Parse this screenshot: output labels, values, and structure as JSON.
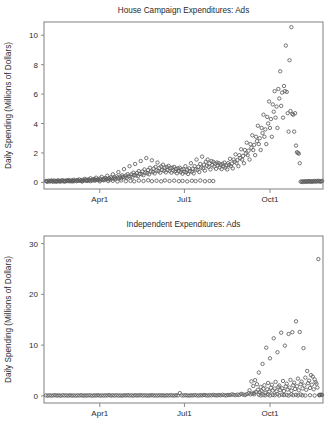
{
  "figure": {
    "background": "#ffffff",
    "marker_color": "#5d5d5d",
    "axis_color": "#8a8a8a",
    "text_color": "#2b2b2b"
  },
  "chart_data": [
    {
      "type": "scatter",
      "id": "house-campaign-ads",
      "title": "House Campaign Expenditures: Ads",
      "xlabel": "",
      "ylabel": "Daily Spending (Millions of Dollars)",
      "xlim": [
        0,
        300
      ],
      "ylim": [
        -0.45,
        10.9
      ],
      "grid": false,
      "legend": null,
      "xticks": [
        60,
        151,
        243
      ],
      "xticklabels": [
        "Apr1",
        "Jul1",
        "Oct1"
      ],
      "yticks": [
        0,
        2,
        4,
        6,
        8,
        10
      ],
      "yticklabels": [
        "0",
        "2",
        "4",
        "6",
        "8",
        "10"
      ],
      "marker": "open-circle",
      "x": [
        2,
        3,
        4,
        5,
        6,
        7,
        8,
        9,
        10,
        11,
        12,
        13,
        14,
        15,
        16,
        17,
        18,
        19,
        20,
        21,
        22,
        23,
        24,
        25,
        26,
        27,
        28,
        29,
        30,
        31,
        32,
        33,
        34,
        35,
        36,
        37,
        38,
        39,
        40,
        41,
        42,
        43,
        44,
        45,
        46,
        47,
        48,
        49,
        50,
        51,
        52,
        53,
        54,
        55,
        56,
        57,
        58,
        59,
        60,
        61,
        62,
        63,
        64,
        65,
        66,
        67,
        68,
        69,
        70,
        71,
        72,
        73,
        74,
        75,
        76,
        77,
        78,
        79,
        80,
        81,
        82,
        83,
        84,
        85,
        86,
        87,
        88,
        89,
        90,
        91,
        92,
        93,
        94,
        95,
        96,
        97,
        98,
        99,
        100,
        101,
        102,
        103,
        104,
        105,
        106,
        107,
        108,
        109,
        110,
        111,
        112,
        113,
        114,
        115,
        116,
        117,
        118,
        119,
        120,
        121,
        122,
        123,
        124,
        125,
        126,
        127,
        128,
        129,
        130,
        131,
        132,
        133,
        134,
        135,
        136,
        137,
        138,
        139,
        140,
        141,
        142,
        143,
        144,
        145,
        146,
        147,
        148,
        149,
        150,
        151,
        152,
        153,
        154,
        155,
        156,
        157,
        158,
        159,
        160,
        161,
        162,
        163,
        164,
        165,
        166,
        167,
        168,
        169,
        170,
        171,
        172,
        173,
        174,
        175,
        176,
        177,
        178,
        179,
        180,
        181,
        182,
        183,
        184,
        185,
        186,
        187,
        188,
        189,
        190,
        191,
        192,
        193,
        194,
        195,
        196,
        197,
        198,
        199,
        200,
        201,
        202,
        203,
        204,
        205,
        206,
        207,
        208,
        209,
        210,
        211,
        212,
        213,
        214,
        215,
        216,
        217,
        218,
        219,
        220,
        221,
        222,
        223,
        224,
        225,
        226,
        227,
        228,
        229,
        230,
        231,
        232,
        233,
        234,
        235,
        236,
        237,
        238,
        239,
        240,
        241,
        242,
        243,
        244,
        245,
        246,
        247,
        248,
        249,
        250,
        251,
        252,
        253,
        254,
        255,
        256,
        257,
        258,
        259,
        260,
        261,
        262,
        263,
        264,
        265,
        266,
        267,
        268,
        269,
        270,
        271,
        272,
        273,
        274,
        275,
        276,
        277,
        278,
        279,
        280,
        281,
        282,
        283,
        284,
        285,
        286,
        287,
        288,
        289,
        290,
        291,
        292,
        293,
        294,
        295,
        296,
        297,
        298,
        299,
        3,
        8,
        13,
        17,
        22,
        27,
        31,
        36,
        41,
        46,
        50,
        55,
        60,
        64,
        69,
        74,
        79,
        83,
        88,
        93,
        97,
        102,
        107,
        112,
        116,
        121,
        126,
        130,
        135,
        140,
        145,
        149,
        154,
        159,
        163,
        168,
        173,
        178,
        182,
        187,
        192,
        196,
        201,
        206,
        211,
        215,
        220,
        225,
        229,
        234,
        239,
        244,
        248,
        253,
        258,
        262,
        267,
        272,
        277,
        281,
        286,
        291,
        295
      ],
      "y": [
        0.1,
        0.07,
        0.05,
        0.12,
        0.08,
        0.06,
        0.11,
        0.09,
        0.04,
        0.13,
        0.07,
        0.1,
        0.06,
        0.14,
        0.09,
        0.05,
        0.12,
        0.08,
        0.15,
        0.07,
        0.11,
        0.06,
        0.13,
        0.09,
        0.16,
        0.08,
        0.12,
        0.07,
        0.14,
        0.1,
        0.18,
        0.09,
        0.13,
        0.08,
        0.16,
        0.11,
        0.2,
        0.1,
        0.15,
        0.09,
        0.18,
        0.13,
        0.24,
        0.12,
        0.17,
        0.11,
        0.21,
        0.15,
        0.28,
        0.14,
        0.19,
        0.13,
        0.23,
        0.17,
        0.32,
        0.16,
        0.22,
        0.15,
        0.26,
        0.19,
        0.38,
        0.18,
        0.25,
        0.17,
        0.3,
        0.22,
        0.45,
        0.21,
        0.29,
        0.2,
        0.35,
        0.26,
        0.55,
        0.25,
        0.34,
        0.23,
        0.41,
        0.31,
        0.7,
        0.29,
        0.4,
        0.27,
        0.48,
        0.36,
        0.9,
        0.34,
        0.47,
        0.31,
        0.56,
        0.42,
        1.1,
        0.4,
        0.55,
        0.36,
        0.66,
        0.5,
        1.25,
        0.47,
        0.64,
        0.42,
        0.77,
        0.58,
        1.45,
        0.55,
        0.74,
        0.49,
        0.88,
        0.66,
        1.65,
        0.62,
        0.84,
        0.55,
        0.99,
        0.74,
        1.5,
        0.7,
        0.94,
        0.61,
        1.05,
        0.8,
        1.35,
        0.76,
        0.99,
        0.66,
        1.08,
        0.84,
        1.2,
        0.79,
        1.0,
        0.68,
        1.05,
        0.84,
        1.12,
        0.78,
        0.97,
        0.66,
        1.0,
        0.8,
        1.05,
        0.74,
        0.92,
        0.62,
        0.95,
        0.76,
        1.0,
        0.7,
        0.88,
        0.59,
        0.9,
        0.72,
        1.1,
        0.68,
        0.86,
        0.57,
        0.95,
        0.76,
        1.3,
        0.72,
        0.92,
        0.61,
        1.1,
        0.88,
        1.55,
        0.84,
        1.06,
        0.7,
        1.25,
        1.0,
        1.75,
        0.95,
        1.2,
        0.8,
        1.4,
        1.12,
        1.55,
        1.05,
        1.3,
        0.88,
        1.45,
        1.18,
        1.4,
        1.08,
        1.28,
        0.92,
        1.35,
        1.15,
        1.3,
        1.02,
        1.2,
        0.9,
        1.25,
        1.1,
        1.35,
        1.0,
        1.15,
        0.88,
        1.3,
        1.18,
        1.6,
        1.1,
        1.28,
        0.95,
        1.55,
        1.4,
        1.9,
        1.3,
        1.52,
        1.1,
        1.85,
        1.65,
        2.25,
        1.55,
        1.8,
        1.3,
        2.2,
        1.95,
        2.7,
        1.85,
        2.15,
        1.55,
        2.6,
        2.35,
        3.2,
        2.2,
        2.55,
        1.85,
        3.1,
        2.8,
        3.85,
        2.6,
        3.0,
        2.2,
        3.7,
        3.35,
        4.6,
        3.1,
        3.6,
        2.6,
        4.45,
        4.0,
        5.5,
        3.7,
        4.3,
        3.1,
        5.3,
        4.8,
        6.2,
        4.4,
        5.15,
        3.7,
        6.35,
        5.7,
        7.55,
        5.2,
        6.1,
        4.4,
        6.55,
        6.2,
        9.3,
        6.15,
        4.7,
        3.45,
        8.3,
        4.85,
        10.55,
        4.65,
        4.6,
        3.45,
        4.7,
        2.5,
        2.05,
        2.0,
        1.95,
        1.3,
        0.05,
        0.04,
        0.06,
        0.03,
        0.07,
        0.05,
        0.08,
        0.04,
        0.06,
        0.09,
        0.05,
        0.07,
        0.04,
        0.08,
        0.06,
        0.1,
        0.05,
        0.09,
        0.07,
        0.11,
        0.06,
        0.08,
        0.05,
        0.1,
        0.07,
        0.12,
        0.06,
        0.09,
        0.08,
        0.11,
        0.07,
        0.13,
        0.06,
        0.1,
        0.08,
        0.12,
        0.07,
        0.14,
        0.09,
        0.11,
        0.06,
        0.13,
        0.08,
        0.1,
        0.07,
        0.12,
        0.09,
        0.14,
        0.08,
        0.11,
        0.07,
        0.13,
        0.09,
        0.12,
        0.08,
        0.1,
        0.07,
        0.11,
        0.09,
        0.13,
        0.08,
        0.1,
        0.09
      ]
    },
    {
      "type": "scatter",
      "id": "independent-expenditures-ads",
      "title": "Independent Expenditures: Ads",
      "xlabel": "",
      "ylabel": "Daily Spending (Millions of Dollars)",
      "xlim": [
        0,
        300
      ],
      "ylim": [
        -1.4,
        31.5
      ],
      "grid": false,
      "legend": null,
      "xticks": [
        60,
        151,
        243
      ],
      "xticklabels": [
        "Apr1",
        "Jul1",
        "Oct1"
      ],
      "yticks": [
        0,
        10,
        20,
        30
      ],
      "yticklabels": [
        "0",
        "10",
        "20",
        "30"
      ],
      "marker": "open-circle",
      "x": [
        2,
        4,
        6,
        8,
        10,
        12,
        14,
        16,
        18,
        20,
        22,
        24,
        26,
        28,
        30,
        32,
        34,
        36,
        38,
        40,
        42,
        44,
        46,
        48,
        50,
        52,
        54,
        56,
        58,
        60,
        62,
        64,
        66,
        68,
        70,
        72,
        74,
        76,
        78,
        80,
        82,
        84,
        86,
        88,
        90,
        92,
        94,
        96,
        98,
        100,
        102,
        104,
        106,
        108,
        110,
        112,
        114,
        116,
        118,
        120,
        122,
        124,
        126,
        128,
        130,
        132,
        134,
        136,
        138,
        140,
        142,
        144,
        146,
        148,
        150,
        152,
        154,
        156,
        158,
        160,
        162,
        164,
        166,
        168,
        170,
        172,
        174,
        176,
        178,
        180,
        182,
        184,
        186,
        188,
        190,
        192,
        194,
        196,
        198,
        200,
        202,
        204,
        206,
        208,
        210,
        212,
        214,
        216,
        218,
        220,
        221,
        222,
        223,
        224,
        225,
        226,
        227,
        228,
        229,
        230,
        231,
        232,
        233,
        234,
        235,
        236,
        237,
        238,
        239,
        240,
        241,
        242,
        243,
        244,
        245,
        246,
        247,
        248,
        249,
        250,
        251,
        252,
        253,
        254,
        255,
        256,
        257,
        258,
        259,
        260,
        261,
        262,
        263,
        264,
        265,
        266,
        267,
        268,
        269,
        270,
        271,
        272,
        273,
        274,
        275,
        276,
        277,
        278,
        279,
        280,
        281,
        282,
        283,
        284,
        285,
        286,
        287,
        288,
        289,
        290,
        291,
        292,
        293,
        294,
        295,
        296,
        297,
        298,
        299,
        226,
        231,
        236,
        241,
        246,
        251,
        256,
        261,
        266,
        271,
        276,
        281,
        286,
        291,
        296,
        233,
        238,
        243,
        248,
        253,
        258,
        263,
        268,
        273,
        278,
        283,
        288,
        293,
        298
      ],
      "y": [
        0.1,
        0.06,
        0.12,
        0.05,
        0.09,
        0.14,
        0.07,
        0.11,
        0.04,
        0.13,
        0.08,
        0.1,
        0.06,
        0.12,
        0.07,
        0.09,
        0.05,
        0.11,
        0.08,
        0.13,
        0.06,
        0.1,
        0.07,
        0.12,
        0.09,
        0.05,
        0.11,
        0.08,
        0.14,
        0.06,
        0.1,
        0.07,
        0.12,
        0.09,
        0.15,
        0.06,
        0.11,
        0.08,
        0.13,
        0.07,
        0.1,
        0.05,
        0.12,
        0.09,
        0.14,
        0.07,
        0.11,
        0.06,
        0.13,
        0.08,
        0.1,
        0.15,
        0.07,
        0.12,
        0.09,
        0.06,
        0.11,
        0.14,
        0.08,
        0.1,
        0.07,
        0.13,
        0.09,
        0.11,
        0.06,
        0.12,
        0.08,
        0.15,
        0.1,
        0.07,
        0.13,
        0.09,
        0.55,
        0.11,
        0.08,
        0.14,
        0.1,
        0.06,
        0.12,
        0.09,
        0.16,
        0.11,
        0.07,
        0.13,
        0.1,
        0.18,
        0.12,
        0.08,
        0.15,
        0.11,
        0.2,
        0.13,
        0.09,
        0.17,
        0.12,
        0.22,
        0.14,
        0.1,
        0.19,
        0.15,
        0.3,
        0.2,
        0.13,
        0.25,
        0.18,
        0.4,
        0.28,
        0.16,
        0.35,
        0.5,
        1.1,
        0.3,
        2.85,
        0.45,
        1.95,
        0.6,
        3.1,
        0.8,
        2.3,
        1.2,
        4.6,
        0.7,
        1.75,
        0.95,
        6.3,
        1.4,
        2.1,
        0.55,
        9.5,
        1.3,
        2.55,
        0.85,
        7.4,
        1.6,
        2.2,
        1.05,
        11.35,
        1.45,
        2.75,
        0.9,
        8.6,
        1.75,
        2.05,
        1.15,
        12.45,
        1.5,
        2.95,
        0.95,
        9.9,
        1.85,
        2.4,
        1.25,
        12.2,
        1.65,
        3.15,
        1.0,
        12.55,
        2.1,
        2.6,
        1.35,
        14.7,
        1.9,
        3.4,
        1.1,
        12.6,
        2.3,
        2.8,
        1.45,
        9.4,
        2.05,
        3.6,
        1.2,
        4.9,
        2.5,
        3.0,
        1.55,
        4.1,
        2.2,
        3.8,
        1.3,
        3.25,
        2.7,
        2.4,
        1.65,
        26.95,
        0.2,
        0.15,
        0.25,
        0.18,
        0.3,
        0.22,
        0.16,
        0.28,
        0.2,
        0.35,
        0.24,
        0.18,
        0.3,
        0.22,
        0.26,
        0.08,
        0.12,
        0.06,
        0.14,
        0.09,
        0.11,
        0.07,
        0.13,
        0.1,
        0.15,
        0.08,
        0.12,
        0.09,
        0.11
      ]
    }
  ]
}
